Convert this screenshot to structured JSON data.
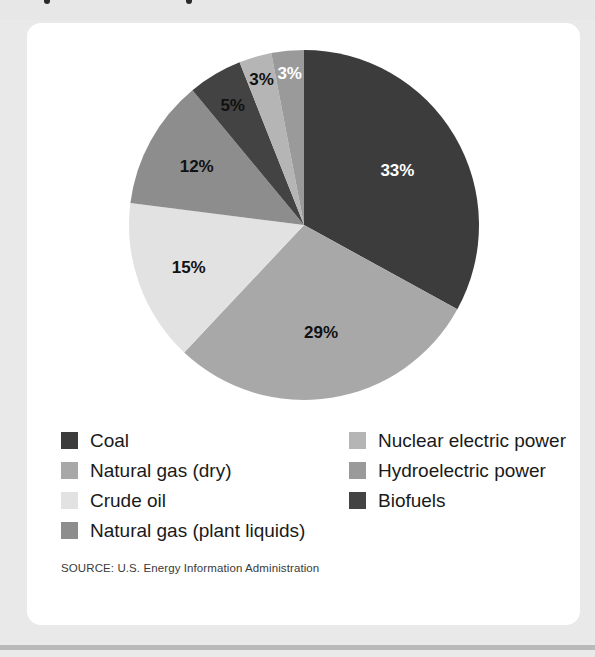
{
  "card": {
    "background": "#ffffff"
  },
  "page": {
    "background": "#e9e9e9",
    "rule_color": "#b9b9b9"
  },
  "chart_data": {
    "type": "pie",
    "title": "",
    "categories": [
      "Coal",
      "Natural gas (dry)",
      "Crude oil",
      "Natural gas (plant liquids)",
      "Biofuels",
      "Nuclear electric power",
      "Hydroelectric power"
    ],
    "values": [
      33,
      29,
      15,
      12,
      5,
      3,
      3
    ],
    "value_labels": [
      "33%",
      "29%",
      "15%",
      "12%",
      "5%",
      "3%",
      "3%"
    ],
    "units": "percent",
    "colors": [
      "#3c3c3c",
      "#a8a8a8",
      "#e2e2e2",
      "#8d8d8d",
      "#434343",
      "#b5b5b5",
      "#9a9a9a"
    ],
    "label_text_colors": [
      "#ffffff",
      "#111111",
      "#111111",
      "#111111",
      "#111111",
      "#111111",
      "#ffffff"
    ],
    "start_angle_deg": 0,
    "direction": "clockwise",
    "legend_position": "bottom",
    "grid": false
  },
  "legend": {
    "left_column": [
      {
        "label": "Coal",
        "color": "#3c3c3c"
      },
      {
        "label": "Natural gas (dry)",
        "color": "#a8a8a8"
      },
      {
        "label": "Crude oil",
        "color": "#e2e2e2"
      },
      {
        "label": "Natural gas (plant liquids)",
        "color": "#8d8d8d"
      }
    ],
    "right_column": [
      {
        "label": "Nuclear electric power",
        "color": "#b5b5b5"
      },
      {
        "label": "Hydroelectric power",
        "color": "#9a9a9a"
      },
      {
        "label": "Biofuels",
        "color": "#434343"
      }
    ]
  },
  "source": {
    "text": "SOURCE: U.S. Energy Information Administration"
  }
}
